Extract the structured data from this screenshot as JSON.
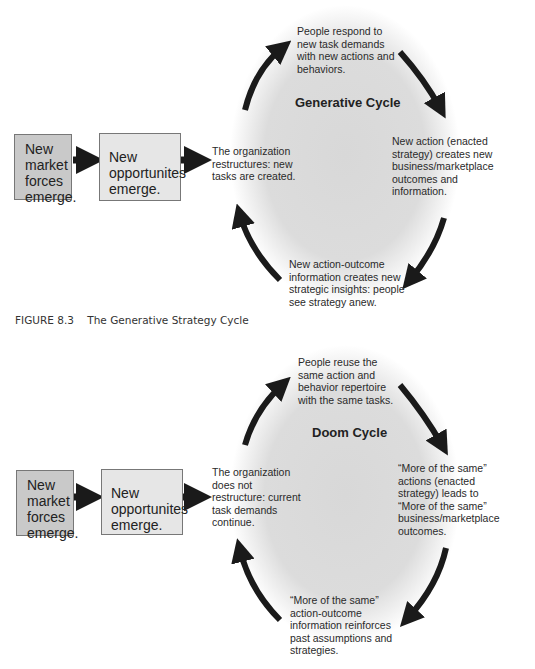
{
  "figure1": {
    "title": "Generative Cycle",
    "box1": [
      "New",
      "market",
      "forces",
      "emerge."
    ],
    "box2": [
      "New",
      "opportunites",
      "emerge."
    ],
    "left_text": [
      "The organization",
      "restructures: new",
      "tasks are created."
    ],
    "top_text": [
      "People respond to",
      "new task demands",
      "with new actions and",
      "behaviors."
    ],
    "right_text": [
      "New action (enacted",
      "strategy) creates new",
      "business/marketplace",
      "outcomes and",
      "information."
    ],
    "bottom_text": [
      "New action-outcome",
      "information creates new",
      "strategic insights: people",
      "see strategy anew."
    ]
  },
  "caption": {
    "number": "FIGURE 8.3",
    "text": "The Generative Strategy Cycle"
  },
  "figure2": {
    "title": "Doom Cycle",
    "box1": [
      "New",
      "market",
      "forces",
      "emerge."
    ],
    "box2": [
      "New",
      "opportunites",
      "emerge."
    ],
    "left_text": [
      "The organization",
      "does not",
      "restructure: current",
      "task demands",
      "continue."
    ],
    "top_text": [
      "People reuse the",
      "same action and",
      "behavior repertoire",
      "with the same tasks."
    ],
    "right_text": [
      "“More of the same”",
      "actions (enacted",
      "strategy) leads to",
      "“More of the same”",
      "business/marketplace",
      "outcomes."
    ],
    "bottom_text": [
      "“More of the same”",
      "action-outcome",
      "information reinforces",
      "past assumptions and",
      "strategies."
    ]
  }
}
